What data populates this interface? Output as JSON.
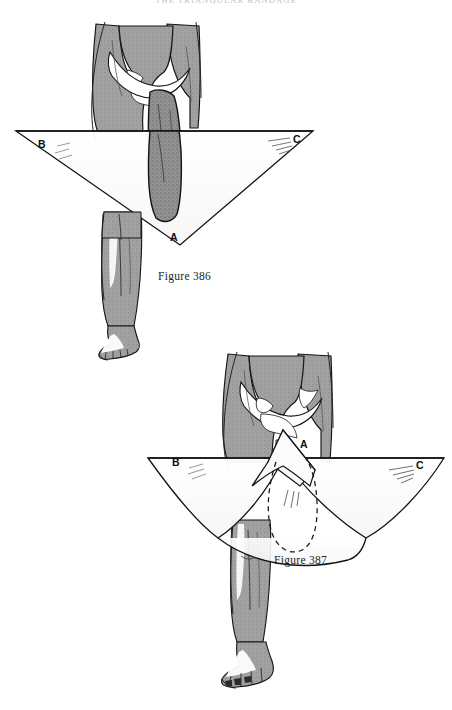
{
  "page": {
    "running_head": "THE TRIANGULAR BANDAGE",
    "background_color": "#ffffff",
    "width": 452,
    "height": 710
  },
  "palette": {
    "ink": "#1a1a1a",
    "skin_tone": "#9e9e9e",
    "skin_tone_dark": "#8c8c8c",
    "skin_highlight": "#ffffff",
    "cloth": "#fdfdfd",
    "outline": "#141414",
    "hatch": "#6d6d6d"
  },
  "figures": [
    {
      "id": "figure-386",
      "caption": "Figure 386",
      "subject": "leg-and-groin-with-triangular-bandage",
      "bandage": {
        "shape": "triangle",
        "orientation": "apex-down",
        "vertices": [
          {
            "label": "A",
            "position": "bottom-apex",
            "x": 173,
            "y": 238
          },
          {
            "label": "B",
            "position": "upper-left",
            "x": 40,
            "y": 146
          },
          {
            "label": "C",
            "position": "upper-right",
            "x": 296,
            "y": 141
          }
        ]
      }
    },
    {
      "id": "figure-387",
      "caption": "Figure 387",
      "subject": "leg-and-groin-with-folded-triangular-bandage",
      "bandage": {
        "shape": "triangle",
        "orientation": "apex-up-folded",
        "dashed_outline": true,
        "vertices": [
          {
            "label": "A",
            "position": "top-apex",
            "x": 304,
            "y": 446
          },
          {
            "label": "B",
            "position": "left-wing",
            "x": 175,
            "y": 464
          },
          {
            "label": "C",
            "position": "right-wing",
            "x": 419,
            "y": 467
          }
        ]
      }
    }
  ]
}
